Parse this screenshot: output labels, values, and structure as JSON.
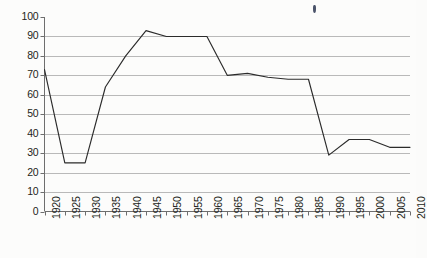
{
  "chart_data": {
    "type": "line",
    "title": "",
    "subtitle": "",
    "xlabel": "",
    "ylabel": "",
    "categories": [
      "1920",
      "1925",
      "1930",
      "1935",
      "1940",
      "1945",
      "1950",
      "1955",
      "1960",
      "1965",
      "1970",
      "1975",
      "1980",
      "1985",
      "1990",
      "1995",
      "2000",
      "2005",
      "2010"
    ],
    "values": [
      73,
      25,
      25,
      64,
      80,
      93,
      90,
      90,
      90,
      70,
      71,
      69,
      68,
      68,
      29,
      37,
      37,
      33,
      33
    ],
    "series": [
      {
        "name": "series-1",
        "values": [
          73,
          25,
          25,
          64,
          80,
          93,
          90,
          90,
          90,
          70,
          71,
          69,
          68,
          68,
          29,
          37,
          37,
          33,
          33
        ]
      }
    ],
    "x": [
      1920,
      1925,
      1930,
      1935,
      1940,
      1945,
      1950,
      1955,
      1960,
      1965,
      1970,
      1975,
      1980,
      1985,
      1990,
      1995,
      2000,
      2005,
      2010
    ],
    "xlim": [
      1920,
      2010
    ],
    "ylim": [
      0,
      100
    ],
    "y_ticks": [
      "0",
      "10",
      "20",
      "30",
      "40",
      "50",
      "60",
      "70",
      "80",
      "90",
      "100"
    ],
    "x_ticks": [
      "1920",
      "1925",
      "1930",
      "1935",
      "1940",
      "1945",
      "1950",
      "1955",
      "1960",
      "1965",
      "1970",
      "1975",
      "1980",
      "1985",
      "1990",
      "1995",
      "2000",
      "2005",
      "2010"
    ],
    "grid": true,
    "grid_axis": "y",
    "legend": false,
    "legend_position": "none",
    "annotations": [],
    "colors": {
      "line": "#2b2b2b",
      "grid": "#b9b9b9",
      "axis": "#6e6e6e",
      "background": "#fcfcfb",
      "text": "#231f20",
      "speck": "#2a3550"
    }
  }
}
